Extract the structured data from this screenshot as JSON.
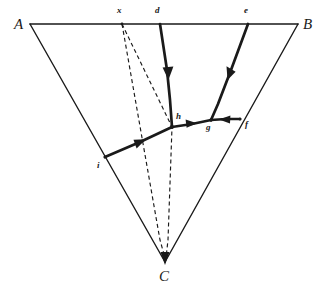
{
  "figure": {
    "background_color": "#ffffff",
    "stroke_color": "#1a1a1a",
    "width": 322,
    "height": 292
  },
  "vertices": [
    {
      "id": "A",
      "label": "A",
      "x": 30,
      "y": 24,
      "label_x": 14,
      "label_y": 17
    },
    {
      "id": "B",
      "label": "B",
      "x": 298,
      "y": 24,
      "label_x": 303,
      "label_y": 17
    },
    {
      "id": "C",
      "label": "C",
      "x": 165,
      "y": 262,
      "label_x": 159,
      "label_y": 269
    }
  ],
  "points": [
    {
      "id": "x",
      "label": "x",
      "x": 122,
      "y": 24,
      "label_x": 117,
      "label_y": 7,
      "on": "AB"
    },
    {
      "id": "d",
      "label": "d",
      "x": 160,
      "y": 24,
      "label_x": 155,
      "label_y": 7,
      "on": "AB"
    },
    {
      "id": "e",
      "label": "e",
      "x": 248,
      "y": 24,
      "label_x": 244,
      "label_y": 7,
      "on": "AB"
    },
    {
      "id": "h",
      "label": "h",
      "x": 172,
      "y": 127,
      "label_x": 176,
      "label_y": 113,
      "on": "interior"
    },
    {
      "id": "g",
      "label": "g",
      "x": 211,
      "y": 120,
      "label_x": 206,
      "label_y": 124,
      "on": "interior"
    },
    {
      "id": "f",
      "label": "f",
      "x": 240,
      "y": 119,
      "label_x": 245,
      "label_y": 121,
      "on": "BC"
    },
    {
      "id": "i",
      "label": "i",
      "x": 105,
      "y": 157,
      "label_x": 97,
      "label_y": 162,
      "on": "AC"
    }
  ],
  "triangle_edges": [
    {
      "id": "AB",
      "from": "A",
      "to": "B",
      "style": "solid",
      "width": 1.4
    },
    {
      "id": "AC",
      "from": "A",
      "to": "C",
      "style": "solid",
      "width": 1.4
    },
    {
      "id": "BC",
      "from": "B",
      "to": "C",
      "style": "solid",
      "width": 1.4
    }
  ],
  "directed_paths": [
    {
      "id": "d-to-h",
      "from": "d",
      "to": "h",
      "style": "solid-bold",
      "width": 2.6,
      "arrow_at": "0.48",
      "description": "bold arrow from d down to h"
    },
    {
      "id": "e-to-g",
      "from": "e",
      "to": "g",
      "style": "solid-bold",
      "width": 2.6,
      "arrow_at": "0.48",
      "description": "bold arrow from e down-left to g"
    },
    {
      "id": "i-to-h",
      "from": "i",
      "to": "h",
      "style": "solid-bold",
      "width": 2.6,
      "arrow_at": "0.50",
      "description": "bold arrow from i up-right to h"
    },
    {
      "id": "h-to-g",
      "from": "h",
      "to": "g",
      "style": "solid-bold",
      "width": 2.6,
      "arrow_at": "0.55",
      "description": "bold arrow from h right to g"
    },
    {
      "id": "f-to-g",
      "from": "f",
      "to": "g",
      "style": "solid-bold",
      "width": 2.6,
      "arrow_at": "0.55",
      "description": "bold arrow from f left to g"
    }
  ],
  "dashed_paths": [
    {
      "id": "x-to-C",
      "from": "x",
      "to": "C",
      "style": "dashed",
      "width": 1.2,
      "arrow_at_end": true,
      "description": "dashed line from x straight to C"
    },
    {
      "id": "x-to-h-to-C",
      "from": "x",
      "via": "h",
      "to": "C",
      "style": "dashed",
      "width": 1.2,
      "arrow_at_end": true,
      "description": "dashed line from x through h down to C"
    }
  ],
  "annotations": {
    "arrowhead_color": "#1a1a1a",
    "dash_pattern": "4 3"
  }
}
